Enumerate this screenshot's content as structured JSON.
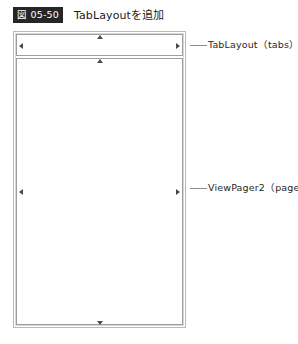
{
  "figure": {
    "badge": "図 05-50",
    "title": "TabLayoutを追加"
  },
  "device_preview": {
    "widgets": [
      {
        "id": "tablayout",
        "callout_label": "TabLayout（tabs）",
        "constraints": [
          "left",
          "right",
          "top"
        ]
      },
      {
        "id": "viewpager",
        "callout_label": "ViewPager2（pager）",
        "constraints": [
          "left",
          "right",
          "top",
          "bottom"
        ]
      }
    ]
  },
  "colors": {
    "badge_background": "#262626",
    "badge_text": "#ffffff",
    "frame_border": "#b9b9b9",
    "widget_border": "#9e9e9e",
    "marker": "#4a4a4a",
    "leader_line": "#8d8d8d",
    "canvas": "#ffffff"
  }
}
